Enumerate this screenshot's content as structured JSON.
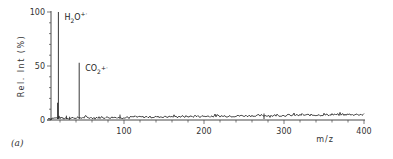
{
  "chart_data": {
    "type": "line",
    "title": "",
    "panel_label": "(a)",
    "xlabel": "m/z",
    "ylabel": "Rel. Int (%)",
    "xlim": [
      0,
      400
    ],
    "ylim": [
      0,
      100
    ],
    "x_ticks": [
      100,
      200,
      300,
      400
    ],
    "x_tick_labels": [
      "100",
      "200",
      "300",
      "400"
    ],
    "x_minor_step": 20,
    "y_ticks": [
      0,
      50,
      100
    ],
    "y_tick_labels": [
      "0",
      "50",
      "100"
    ],
    "y_minor_step": 10,
    "grid": false,
    "legend": "none",
    "peaks": [
      {
        "mz": 17,
        "intensity": 16
      },
      {
        "mz": 18,
        "intensity": 100,
        "label": "H2O+·",
        "label_main": "H",
        "label_sub": "2",
        "label_rest": "O",
        "label_sup": "+·"
      },
      {
        "mz": 44,
        "intensity": 53,
        "label": "CO2+·",
        "label_main": "CO",
        "label_sub": "2",
        "label_rest": "",
        "label_sup": "+·"
      },
      {
        "mz": 95,
        "intensity": 5
      },
      {
        "mz": 28,
        "intensity": 4
      },
      {
        "mz": 32,
        "intensity": 3
      },
      {
        "mz": 275,
        "intensity": 6
      }
    ],
    "baseline": {
      "description": "noisy baseline spanning m/z 5-400",
      "x_start": 5,
      "x_end": 400,
      "level_start": 1.5,
      "level_end": 5,
      "noise_amplitude": 2
    }
  }
}
